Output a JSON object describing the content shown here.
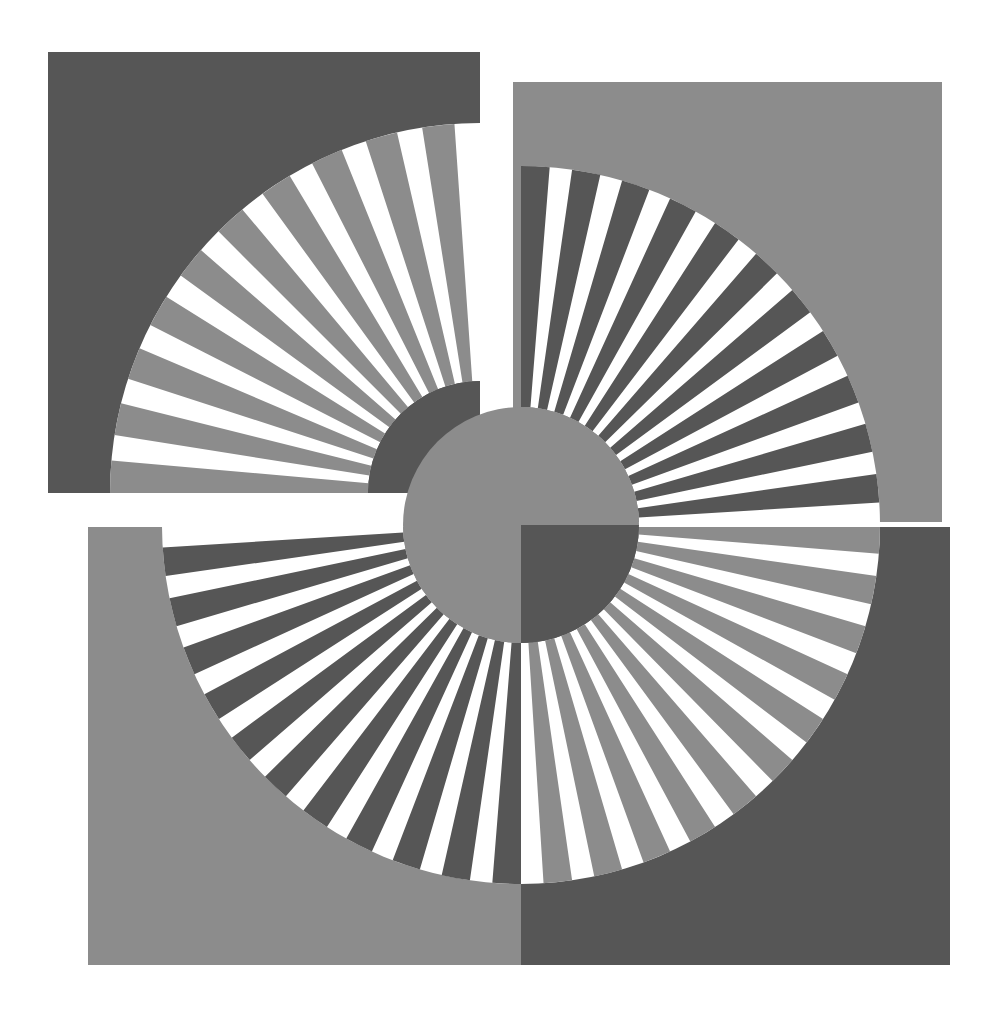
{
  "artwork": {
    "title": "Radial Sunburst Composition",
    "canvas": {
      "width": 994,
      "height": 1016,
      "background": "#ffffff"
    },
    "palette": {
      "dark_gray": "#565656",
      "light_gray": "#8c8c8c",
      "white": "#ffffff"
    },
    "panels": [
      {
        "id": "panel-top-left",
        "name": "Top-left square panel",
        "x": 48,
        "y": 52,
        "width": 432,
        "height": 441,
        "background": "#565656",
        "spoke_color": "#8c8c8c",
        "gap_color": "#ffffff",
        "burst": {
          "center_x": 480,
          "center_y": 493,
          "inner_radius": 112,
          "outer_radius": 370,
          "start_angle": 180,
          "end_angle": 270,
          "spoke_count": 10,
          "spoke_duty": 0.56,
          "hub_color": "#565656"
        }
      },
      {
        "id": "panel-top-right",
        "name": "Top-right square panel",
        "x": 513,
        "y": 82,
        "width": 429,
        "height": 440,
        "background": "#8c8c8c",
        "spoke_color": "#565656",
        "gap_color": "#ffffff",
        "burst": {
          "center_x": 521,
          "center_y": 525,
          "inner_radius": 118,
          "outer_radius": 359,
          "start_angle": 270,
          "end_angle": 360,
          "spoke_count": 11,
          "spoke_duty": 0.56,
          "hub_color": "#8c8c8c"
        }
      },
      {
        "id": "panel-bottom-left",
        "name": "Bottom-left quadrant panel",
        "x": 88,
        "y": 527,
        "width": 433,
        "height": 438,
        "background": "#8c8c8c",
        "spoke_color": "#565656",
        "gap_color": "#ffffff",
        "burst": {
          "center_x": 521,
          "center_y": 525,
          "inner_radius": 118,
          "outer_radius": 359,
          "start_angle": 90,
          "end_angle": 180,
          "spoke_count": 11,
          "spoke_duty": 0.56,
          "hub_color": "#8c8c8c"
        }
      },
      {
        "id": "panel-bottom-right",
        "name": "Bottom-right quadrant panel",
        "x": 521,
        "y": 527,
        "width": 429,
        "height": 438,
        "background": "#565656",
        "spoke_color": "#8c8c8c",
        "gap_color": "#ffffff",
        "burst": {
          "center_x": 521,
          "center_y": 525,
          "inner_radius": 118,
          "outer_radius": 359,
          "start_angle": 0,
          "end_angle": 90,
          "spoke_count": 11,
          "spoke_duty": 0.56,
          "hub_color": "#565656"
        }
      }
    ],
    "hub_quadrants": [
      {
        "id": "hub-top-left",
        "quadrant": "top-left",
        "color": "#8c8c8c"
      },
      {
        "id": "hub-top-right",
        "quadrant": "top-right",
        "color": "#8c8c8c"
      },
      {
        "id": "hub-bottom-left",
        "quadrant": "bottom-left",
        "color": "#8c8c8c"
      },
      {
        "id": "hub-bottom-right",
        "quadrant": "bottom-right",
        "color": "#565656"
      }
    ],
    "small_hub": {
      "center_x": 480,
      "center_y": 493,
      "radius": 112,
      "color": "#565656"
    }
  }
}
